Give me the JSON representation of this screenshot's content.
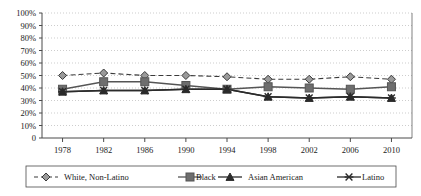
{
  "chart_data": {
    "type": "line",
    "title": "",
    "subtitle": "",
    "xlabel": "",
    "ylabel": "",
    "x": [
      1978,
      1982,
      1986,
      1990,
      1994,
      1998,
      2002,
      2006,
      2010
    ],
    "categories": [
      "1978",
      "1982",
      "1986",
      "1990",
      "1994",
      "1998",
      "2002",
      "2006",
      "2010"
    ],
    "xtick_labels": [
      "1978",
      "1982",
      "1986",
      "1990",
      "1994",
      "1998",
      "2002",
      "2006",
      "2010"
    ],
    "ytick_labels": [
      "100%",
      "90%",
      "80%",
      "70%",
      "60%",
      "50%",
      "40%",
      "30%",
      "20%",
      "10%",
      "0"
    ],
    "ytick_values": [
      100,
      90,
      80,
      70,
      60,
      50,
      40,
      30,
      20,
      10,
      0
    ],
    "ylim": [
      0,
      100
    ],
    "grid": true,
    "grid_style": "dotted-horizontal",
    "legend_position": "bottom",
    "legend_boxed": true,
    "series": [
      {
        "name": "White, Non-Latino",
        "marker": "diamond",
        "line_style": "dashed",
        "color": "#3a3a3a",
        "values": [
          50,
          52,
          50,
          50,
          49,
          47,
          47,
          49,
          47
        ]
      },
      {
        "name": "Black",
        "marker": "square",
        "line_style": "solid",
        "color": "#555555",
        "values": [
          39,
          45,
          45,
          42,
          39,
          41,
          40,
          39,
          41
        ]
      },
      {
        "name": "Asian American",
        "marker": "triangle",
        "line_style": "solid",
        "color": "#2b2b2b",
        "values": [
          37,
          38,
          38,
          39,
          39,
          33,
          32,
          33,
          32
        ]
      },
      {
        "name": "Latino",
        "marker": "x-cross",
        "line_style": "solid",
        "color": "#2b2b2b",
        "values": [
          37,
          38,
          38,
          39,
          39,
          33,
          32,
          33,
          32
        ]
      }
    ]
  },
  "legend": {
    "items": [
      {
        "label": "White, Non-Latino",
        "icon": "diamond-marker-icon"
      },
      {
        "label": "Black",
        "icon": "square-marker-icon"
      },
      {
        "label": "Asian American",
        "icon": "triangle-marker-icon"
      },
      {
        "label": "Latino",
        "icon": "x-marker-icon"
      }
    ]
  },
  "colors": {
    "plot_border": "#4a4a4a",
    "gridline": "#b8b8b8",
    "white_non_latino": "#3a3a3a",
    "black_series": "#555555",
    "asian_american": "#2b2b2b",
    "latino": "#2b2b2b",
    "background": "#ffffff"
  }
}
